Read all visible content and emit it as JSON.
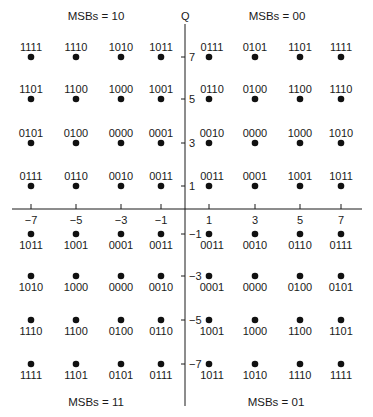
{
  "diagram": {
    "type": "16-QAM constellation diagram (Gray coded, quadrant MSBs)",
    "axis_q_label": "Q",
    "x_ticks": [
      -7,
      -5,
      -3,
      -1,
      1,
      3,
      5,
      7
    ],
    "y_ticks": [
      7,
      5,
      3,
      1,
      -1,
      -3,
      -5,
      -7
    ],
    "x_tick_labels": [
      "−7",
      "−5",
      "−3",
      "−1",
      "1",
      "3",
      "5",
      "7"
    ],
    "y_tick_labels": [
      "7",
      "5",
      "3",
      "1",
      "−1",
      "−3",
      "−5",
      "−7"
    ],
    "quadrants": [
      {
        "id": "q2",
        "label": "MSBs = 10",
        "position": "top-left"
      },
      {
        "id": "q1",
        "label": "MSBs = 00",
        "position": "top-right"
      },
      {
        "id": "q3",
        "label": "MSBs = 11",
        "position": "bottom-left"
      },
      {
        "id": "q4",
        "label": "MSBs = 01",
        "position": "bottom-right"
      }
    ],
    "points": [
      {
        "i": -7,
        "q": 7,
        "label": "1111"
      },
      {
        "i": -5,
        "q": 7,
        "label": "1110"
      },
      {
        "i": -3,
        "q": 7,
        "label": "1010"
      },
      {
        "i": -1,
        "q": 7,
        "label": "1011"
      },
      {
        "i": 1,
        "q": 7,
        "label": "0111"
      },
      {
        "i": 3,
        "q": 7,
        "label": "0101"
      },
      {
        "i": 5,
        "q": 7,
        "label": "1101"
      },
      {
        "i": 7,
        "q": 7,
        "label": "1111"
      },
      {
        "i": -7,
        "q": 5,
        "label": "1101"
      },
      {
        "i": -5,
        "q": 5,
        "label": "1100"
      },
      {
        "i": -3,
        "q": 5,
        "label": "1000"
      },
      {
        "i": -1,
        "q": 5,
        "label": "1001"
      },
      {
        "i": 1,
        "q": 5,
        "label": "0110"
      },
      {
        "i": 3,
        "q": 5,
        "label": "0100"
      },
      {
        "i": 5,
        "q": 5,
        "label": "1100"
      },
      {
        "i": 7,
        "q": 5,
        "label": "1110"
      },
      {
        "i": -7,
        "q": 3,
        "label": "0101"
      },
      {
        "i": -5,
        "q": 3,
        "label": "0100"
      },
      {
        "i": -3,
        "q": 3,
        "label": "0000"
      },
      {
        "i": -1,
        "q": 3,
        "label": "0001"
      },
      {
        "i": 1,
        "q": 3,
        "label": "0010"
      },
      {
        "i": 3,
        "q": 3,
        "label": "0000"
      },
      {
        "i": 5,
        "q": 3,
        "label": "1000"
      },
      {
        "i": 7,
        "q": 3,
        "label": "1010"
      },
      {
        "i": -7,
        "q": 1,
        "label": "0111"
      },
      {
        "i": -5,
        "q": 1,
        "label": "0110"
      },
      {
        "i": -3,
        "q": 1,
        "label": "0010"
      },
      {
        "i": -1,
        "q": 1,
        "label": "0011"
      },
      {
        "i": 1,
        "q": 1,
        "label": "0011"
      },
      {
        "i": 3,
        "q": 1,
        "label": "0001"
      },
      {
        "i": 5,
        "q": 1,
        "label": "1001"
      },
      {
        "i": 7,
        "q": 1,
        "label": "1011"
      },
      {
        "i": -7,
        "q": -1,
        "label": "1011"
      },
      {
        "i": -5,
        "q": -1,
        "label": "1001"
      },
      {
        "i": -3,
        "q": -1,
        "label": "0001"
      },
      {
        "i": -1,
        "q": -1,
        "label": "0011"
      },
      {
        "i": 1,
        "q": -1,
        "label": "0011"
      },
      {
        "i": 3,
        "q": -1,
        "label": "0010"
      },
      {
        "i": 5,
        "q": -1,
        "label": "0110"
      },
      {
        "i": 7,
        "q": -1,
        "label": "0111"
      },
      {
        "i": -7,
        "q": -3,
        "label": "1010"
      },
      {
        "i": -5,
        "q": -3,
        "label": "1000"
      },
      {
        "i": -3,
        "q": -3,
        "label": "0000"
      },
      {
        "i": -1,
        "q": -3,
        "label": "0010"
      },
      {
        "i": 1,
        "q": -3,
        "label": "0001"
      },
      {
        "i": 3,
        "q": -3,
        "label": "0000"
      },
      {
        "i": 5,
        "q": -3,
        "label": "0100"
      },
      {
        "i": 7,
        "q": -3,
        "label": "0101"
      },
      {
        "i": -7,
        "q": -5,
        "label": "1110"
      },
      {
        "i": -5,
        "q": -5,
        "label": "1100"
      },
      {
        "i": -3,
        "q": -5,
        "label": "0100"
      },
      {
        "i": -1,
        "q": -5,
        "label": "0110"
      },
      {
        "i": 1,
        "q": -5,
        "label": "1001"
      },
      {
        "i": 3,
        "q": -5,
        "label": "1000"
      },
      {
        "i": 5,
        "q": -5,
        "label": "1100"
      },
      {
        "i": 7,
        "q": -5,
        "label": "1101"
      },
      {
        "i": -7,
        "q": -7,
        "label": "1111"
      },
      {
        "i": -5,
        "q": -7,
        "label": "1101"
      },
      {
        "i": -3,
        "q": -7,
        "label": "0101"
      },
      {
        "i": -1,
        "q": -7,
        "label": "0111"
      },
      {
        "i": 1,
        "q": -7,
        "label": "1011"
      },
      {
        "i": 3,
        "q": -7,
        "label": "1010"
      },
      {
        "i": 5,
        "q": -7,
        "label": "1110"
      },
      {
        "i": 7,
        "q": -7,
        "label": "1111"
      }
    ],
    "colors": {
      "ink": "#1a1a1a",
      "background": "#ffffff"
    }
  }
}
